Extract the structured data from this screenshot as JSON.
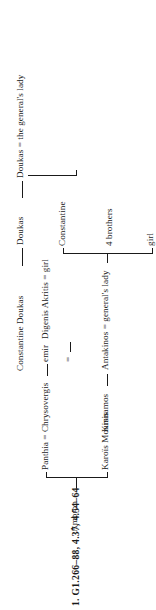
{
  "figure": {
    "title": "1. G1.266–88, 4.37, 4.54–64",
    "type": "genealogical-stemma",
    "orientation": "rotated-90-ccw",
    "nodes": [
      {
        "id": "ambron",
        "label": "Ambron",
        "generation": 1
      },
      {
        "id": "karois-moursis",
        "label": "Karoïs Moursis",
        "generation": 2
      },
      {
        "id": "panthia",
        "label": "Panthia = Chrysovergis",
        "generation": 2
      },
      {
        "id": "emir",
        "label": "emir",
        "generation": 3
      },
      {
        "id": "emir-girl",
        "label": "=",
        "generation": 3
      },
      {
        "id": "digenis",
        "label": "Digenis Akritis = girl",
        "generation": 4
      },
      {
        "id": "kinnamos",
        "label": "Kinnamos",
        "generation": 1
      },
      {
        "id": "antakinos",
        "label": "Antakinos = general's lady",
        "generation": 2
      },
      {
        "id": "girl",
        "label": "girl",
        "generation": 3
      },
      {
        "id": "four-brothers",
        "label": "4 brothers",
        "generation": 3
      },
      {
        "id": "constantine",
        "label": "Constantine",
        "generation": 3
      },
      {
        "id": "doukas",
        "label": "Doukas",
        "generation": 2
      },
      {
        "id": "constantine-doukas",
        "label": "Constantine Doukas",
        "generation": 1
      },
      {
        "id": "doukas-lady",
        "label": "Doukas = the general's lady",
        "generation": 2
      }
    ],
    "edges": [
      {
        "from": "ambron",
        "to": [
          "karois-moursis",
          "panthia"
        ]
      },
      {
        "from": "panthia",
        "to": [
          "emir"
        ]
      },
      {
        "from": "emir",
        "to": [
          "digenis"
        ]
      },
      {
        "from": "kinnamos",
        "to": [
          "antakinos"
        ]
      },
      {
        "from": "antakinos",
        "to": [
          "girl",
          "four-brothers",
          "constantine"
        ]
      },
      {
        "from": "constantine-doukas",
        "to": [
          "doukas"
        ]
      },
      {
        "from": "doukas",
        "to": [
          "doukas-lady"
        ]
      },
      {
        "from": "doukas-lady",
        "to": [
          "digenis"
        ]
      }
    ]
  }
}
